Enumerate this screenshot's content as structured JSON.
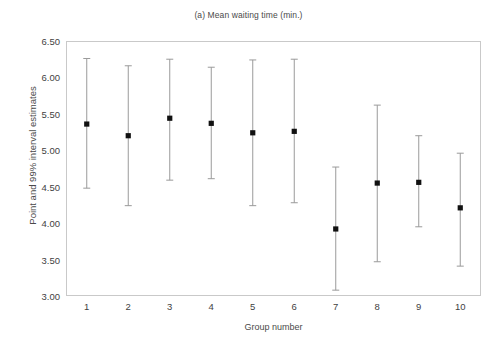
{
  "chart_data": {
    "type": "scatter",
    "title": "(a) Mean waiting time (min.)",
    "xlabel": "Group number",
    "ylabel": "Point and 99% interval estimates",
    "categories": [
      "1",
      "2",
      "3",
      "4",
      "5",
      "6",
      "7",
      "8",
      "9",
      "10"
    ],
    "x": [
      1,
      2,
      3,
      4,
      5,
      6,
      7,
      8,
      9,
      10
    ],
    "values": [
      5.36,
      5.2,
      5.44,
      5.37,
      5.24,
      5.26,
      3.92,
      4.55,
      4.56,
      4.21
    ],
    "error_lower": [
      4.48,
      4.24,
      4.59,
      4.61,
      4.24,
      4.28,
      3.08,
      3.47,
      3.95,
      3.41
    ],
    "error_upper": [
      6.26,
      6.16,
      6.25,
      6.14,
      6.24,
      6.25,
      4.77,
      5.62,
      5.2,
      4.96
    ],
    "series": [
      {
        "name": "Point and 99% interval estimates",
        "points": [
          {
            "group": "1",
            "estimate": 5.36,
            "lower": 4.48,
            "upper": 6.26
          },
          {
            "group": "2",
            "estimate": 5.2,
            "lower": 4.24,
            "upper": 6.16
          },
          {
            "group": "3",
            "estimate": 5.44,
            "lower": 4.59,
            "upper": 6.25
          },
          {
            "group": "4",
            "estimate": 5.37,
            "lower": 4.61,
            "upper": 6.14
          },
          {
            "group": "5",
            "estimate": 5.24,
            "lower": 4.24,
            "upper": 6.24
          },
          {
            "group": "6",
            "estimate": 5.26,
            "lower": 4.28,
            "upper": 6.25
          },
          {
            "group": "7",
            "estimate": 3.92,
            "lower": 3.08,
            "upper": 4.77
          },
          {
            "group": "8",
            "estimate": 4.55,
            "lower": 3.47,
            "upper": 5.62
          },
          {
            "group": "9",
            "estimate": 4.56,
            "lower": 3.95,
            "upper": 5.2
          },
          {
            "group": "10",
            "estimate": 4.21,
            "lower": 3.41,
            "upper": 4.96
          }
        ]
      }
    ],
    "ylim": [
      3.0,
      6.5
    ],
    "xlim": [
      0.5,
      10.5
    ],
    "yticks": [
      3.0,
      3.5,
      4.0,
      4.5,
      5.0,
      5.5,
      6.0,
      6.5
    ],
    "ytick_labels": [
      "3.00",
      "3.50",
      "4.00",
      "4.50",
      "5.00",
      "5.50",
      "6.00",
      "6.50"
    ],
    "xticks": [
      1,
      2,
      3,
      4,
      5,
      6,
      7,
      8,
      9,
      10
    ],
    "xtick_labels": [
      "1",
      "2",
      "3",
      "4",
      "5",
      "6",
      "7",
      "8",
      "9",
      "10"
    ],
    "grid": false,
    "legend": null,
    "legend_position": "none",
    "colors": {
      "marker": "#111111",
      "errorbar": "#9a9a9a",
      "frame": "#c9c9c9",
      "text": "#3f3f3f",
      "background": "#ffffff"
    }
  }
}
